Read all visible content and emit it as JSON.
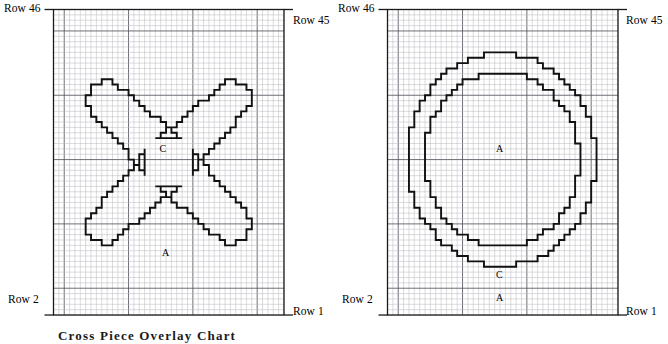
{
  "figure": {
    "caption": "Cross Piece Overlay Chart",
    "background": "#ffffff",
    "grid_color": "#b9b9be",
    "grid_major_color": "#555560",
    "outline_color": "#111111",
    "border_color": "#1a1a1a"
  },
  "panels": [
    {
      "id": "left",
      "name": "cross-chart",
      "labels": {
        "top_left": "Row 46",
        "top_right": "Row 45",
        "bottom_left": "Row 2",
        "bottom_right": "Row 1"
      },
      "cell_labels": [
        {
          "text": "C",
          "col": 20.5,
          "row": 31.0
        },
        {
          "text": "A",
          "col": 21.0,
          "row": 11.5
        }
      ],
      "grid": {
        "cols": 43,
        "rows": 57,
        "major_cols": [
          2,
          14,
          26,
          38
        ],
        "major_rows": [
          5,
          17,
          29,
          41,
          53
        ]
      }
    },
    {
      "id": "right",
      "name": "circle-chart",
      "labels": {
        "top_left": "Row 46",
        "top_right": "Row 45",
        "bottom_left": "Row 2",
        "bottom_right": "Row 1"
      },
      "cell_labels": [
        {
          "text": "A",
          "col": 21.0,
          "row": 31.0
        },
        {
          "text": "C",
          "col": 21.0,
          "row": 7.5
        },
        {
          "text": "A",
          "col": 21.0,
          "row": 3.2
        }
      ],
      "grid": {
        "cols": 43,
        "rows": 57,
        "major_cols": [
          2,
          14,
          26,
          38
        ],
        "major_rows": [
          5,
          17,
          29,
          41,
          53
        ]
      }
    }
  ],
  "chart_data": {
    "type": "heatmap",
    "title": "Cross Piece Overlay Chart",
    "xlabel": "",
    "ylabel": "",
    "grid": true,
    "legend": "none",
    "row_labels": [
      "Row 46",
      "Row 45",
      "Row 2",
      "Row 1"
    ],
    "region_labels": [
      "A",
      "C"
    ],
    "series": [
      {
        "name": "left-cross-outline",
        "shape": "X / cross",
        "units": "grid cells",
        "grid_cols": 43,
        "grid_rows": 57
      },
      {
        "name": "right-outer-circle",
        "shape": "ellipse",
        "units": "grid cells",
        "grid_cols": 43,
        "grid_rows": 57
      },
      {
        "name": "right-inner-circle",
        "shape": "ellipse",
        "units": "grid cells",
        "grid_cols": 43,
        "grid_rows": 57
      }
    ]
  }
}
